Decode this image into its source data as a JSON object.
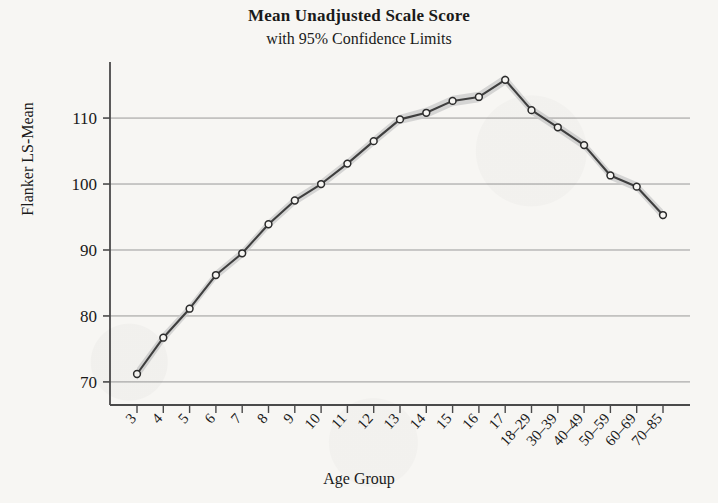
{
  "chart_data": {
    "type": "line",
    "title": "Mean Unadjusted Scale Score",
    "subtitle": "with 95% Confidence Limits",
    "xlabel": "Age Group",
    "ylabel": "Flanker LS-Mean",
    "categories": [
      "3",
      "4",
      "5",
      "6",
      "7",
      "8",
      "9",
      "10",
      "11",
      "12",
      "13",
      "14",
      "15",
      "16",
      "17",
      "18–29",
      "30–39",
      "40–49",
      "50–59",
      "60–69",
      "70–85"
    ],
    "values": [
      71.2,
      76.7,
      81.1,
      86.2,
      89.5,
      93.9,
      97.5,
      100.0,
      103.1,
      106.5,
      109.8,
      110.8,
      112.6,
      113.2,
      115.8,
      111.2,
      108.6,
      105.9,
      101.3,
      99.6,
      95.3
    ],
    "ci_lower": [
      70.3,
      75.9,
      80.4,
      85.5,
      88.8,
      93.2,
      96.8,
      99.3,
      102.4,
      105.8,
      109.1,
      110.0,
      111.8,
      112.4,
      115.0,
      110.5,
      107.9,
      105.2,
      100.6,
      98.9,
      94.5
    ],
    "ci_upper": [
      72.1,
      77.5,
      81.8,
      86.9,
      90.2,
      94.6,
      98.2,
      100.7,
      103.8,
      107.2,
      110.5,
      111.6,
      113.4,
      114.0,
      116.6,
      111.9,
      109.3,
      106.6,
      102.0,
      100.3,
      96.1
    ],
    "yticks": [
      70,
      80,
      90,
      100,
      110
    ],
    "ytick_labels": [
      "70",
      "80",
      "90",
      "100",
      "110"
    ],
    "ylim": [
      66.5,
      118.5
    ],
    "grid": "horizontal",
    "legend": "none",
    "series_name": "Flanker LS-Mean",
    "band_label": "95% Confidence Limits",
    "colors": {
      "line": "#3f3f3f",
      "marker_stroke": "#2b2b2b",
      "marker_fill": "#f7f6f3",
      "band": "#c9c9c9",
      "grid": "#8a8a8a",
      "axis": "#4a4a4a",
      "background": "#f7f6f3",
      "text": "#1a1a1a"
    }
  }
}
